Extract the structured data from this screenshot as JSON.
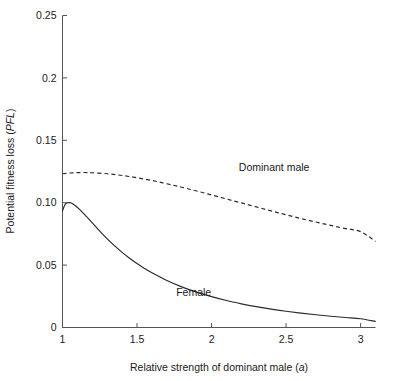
{
  "chart_data": {
    "type": "line",
    "title": "",
    "xlabel": "Relative strength of dominant male (a)",
    "xlabel_plain": "Relative strength of dominant male (",
    "xlabel_italic": "a",
    "xlabel_close": ")",
    "ylabel_plain": "Potential fitness loss (",
    "ylabel_italic": "PFL",
    "ylabel_close": ")",
    "ylabel": "Potential fitness loss (PFL)",
    "xlim": [
      1,
      3.1
    ],
    "ylim": [
      0,
      0.25
    ],
    "grid": false,
    "legend_position": "inline-annotations",
    "xticks": [
      1,
      1.5,
      2,
      2.5,
      3
    ],
    "xtick_labels": [
      "1",
      "1.5",
      "2",
      "2.5",
      "3"
    ],
    "yticks": [
      0,
      0.05,
      0.1,
      0.15,
      0.2,
      0.25
    ],
    "ytick_labels": [
      "0",
      "0.05",
      "0.10",
      "0.15",
      "0.2",
      "0.25"
    ],
    "series": [
      {
        "name": "Dominant male",
        "style": "dashed",
        "color": "#2b2b2b",
        "label_x": 2.42,
        "label_y": 0.1255,
        "x": [
          1.0,
          1.05,
          1.1,
          1.15,
          1.2,
          1.3,
          1.4,
          1.5,
          1.6,
          1.7,
          1.8,
          1.9,
          2.0,
          2.1,
          2.2,
          2.3,
          2.4,
          2.5,
          2.6,
          2.7,
          2.8,
          2.9,
          3.0,
          3.1
        ],
        "y": [
          0.1232,
          0.1238,
          0.1241,
          0.1242,
          0.124,
          0.1232,
          0.1218,
          0.12,
          0.1178,
          0.1152,
          0.1124,
          0.1094,
          0.1062,
          0.103,
          0.0998,
          0.0966,
          0.0934,
          0.0903,
          0.0873,
          0.0845,
          0.0818,
          0.0792,
          0.0768,
          0.069
        ]
      },
      {
        "name": "Female",
        "style": "solid",
        "color": "#2b2b2b",
        "label_x": 1.88,
        "label_y": 0.0255,
        "x": [
          1.0,
          1.02,
          1.05,
          1.08,
          1.12,
          1.16,
          1.2,
          1.25,
          1.3,
          1.35,
          1.4,
          1.45,
          1.5,
          1.55,
          1.6,
          1.7,
          1.8,
          1.9,
          2.0,
          2.1,
          2.2,
          2.3,
          2.4,
          2.5,
          2.6,
          2.7,
          2.8,
          2.9,
          3.0,
          3.1
        ],
        "y": [
          0.0935,
          0.099,
          0.1,
          0.0982,
          0.094,
          0.089,
          0.0838,
          0.0772,
          0.071,
          0.0654,
          0.0602,
          0.0555,
          0.0512,
          0.0473,
          0.0438,
          0.0377,
          0.0326,
          0.0283,
          0.0247,
          0.0216,
          0.019,
          0.0167,
          0.0147,
          0.013,
          0.0115,
          0.0102,
          0.009,
          0.008,
          0.007,
          0.0048
        ]
      }
    ],
    "annotations": [
      {
        "text": "Dominant male",
        "x": 2.42,
        "y": 0.1255
      },
      {
        "text": "Female",
        "x": 1.88,
        "y": 0.0255
      }
    ]
  },
  "axis_colors": {
    "axis": "#555555",
    "curve": "#2b2b2b",
    "background": "#ffffff"
  }
}
